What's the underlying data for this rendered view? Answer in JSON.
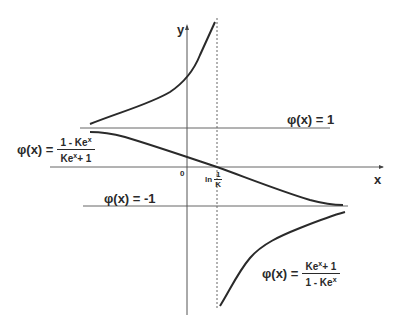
{
  "diagram": {
    "type": "function-graph",
    "axes": {
      "x_label": "x",
      "y_label": "y",
      "origin_label": "0",
      "asymptote_label_prefix": "ln",
      "asymptote_label_num": "1",
      "asymptote_label_den": "K"
    },
    "asymptotes": {
      "upper": {
        "label": "φ(x) = 1"
      },
      "lower": {
        "label": "φ(x) = -1"
      }
    },
    "formulas": {
      "left": {
        "lhs": "φ(x) =",
        "numerator": "1 - Ke",
        "numerator_sup": "x",
        "denominator": "Ke",
        "denominator_sup": "x",
        "denominator_tail": "+ 1"
      },
      "right": {
        "lhs": "φ(x) =",
        "numerator": "Ke",
        "numerator_sup": "x",
        "numerator_tail": "+ 1",
        "denominator": "1 - Ke",
        "denominator_sup": "x"
      }
    },
    "colors": {
      "ink": "#2a2a2a",
      "axis": "#555555",
      "background": "#ffffff"
    }
  }
}
